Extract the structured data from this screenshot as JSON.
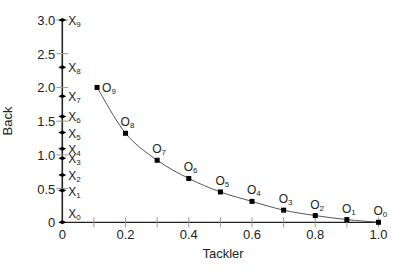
{
  "chart_data": {
    "type": "line",
    "title": "",
    "xlabel": "Tackler",
    "ylabel": "Back",
    "xlim": [
      0,
      1.0
    ],
    "ylim": [
      0,
      3.0
    ],
    "grid": false,
    "legend": null,
    "x_ticks": [
      {
        "value": 0,
        "label": "0"
      },
      {
        "value": 0.1,
        "label": ""
      },
      {
        "value": 0.2,
        "label": "0.2"
      },
      {
        "value": 0.3,
        "label": ""
      },
      {
        "value": 0.4,
        "label": "0.4"
      },
      {
        "value": 0.5,
        "label": ""
      },
      {
        "value": 0.6,
        "label": "0.6"
      },
      {
        "value": 0.7,
        "label": ""
      },
      {
        "value": 0.8,
        "label": "0.8"
      },
      {
        "value": 0.9,
        "label": ""
      },
      {
        "value": 1.0,
        "label": "1.0"
      }
    ],
    "y_ticks": [
      {
        "value": 0,
        "label": "0"
      },
      {
        "value": 0.5,
        "label": "0.5"
      },
      {
        "value": 1.0,
        "label": "1.0"
      },
      {
        "value": 1.5,
        "label": "1.5"
      },
      {
        "value": 2.0,
        "label": "2.0"
      },
      {
        "value": 2.5,
        "label": "2.5"
      },
      {
        "value": 3.0,
        "label": "3.0"
      }
    ],
    "series": [
      {
        "name": "O",
        "marker": "square",
        "connected": true,
        "points": [
          {
            "label": "O",
            "sub": "0",
            "x": 1.0,
            "y": 0.0
          },
          {
            "label": "O",
            "sub": "1",
            "x": 0.9,
            "y": 0.04
          },
          {
            "label": "O",
            "sub": "2",
            "x": 0.8,
            "y": 0.1
          },
          {
            "label": "O",
            "sub": "3",
            "x": 0.7,
            "y": 0.18
          },
          {
            "label": "O",
            "sub": "4",
            "x": 0.6,
            "y": 0.31
          },
          {
            "label": "O",
            "sub": "5",
            "x": 0.5,
            "y": 0.45
          },
          {
            "label": "O",
            "sub": "6",
            "x": 0.4,
            "y": 0.65
          },
          {
            "label": "O",
            "sub": "7",
            "x": 0.3,
            "y": 0.92
          },
          {
            "label": "O",
            "sub": "8",
            "x": 0.2,
            "y": 1.32
          },
          {
            "label": "O",
            "sub": "9",
            "x": 0.11,
            "y": 2.0
          }
        ]
      },
      {
        "name": "X",
        "marker": "diamond",
        "connected": false,
        "points": [
          {
            "label": "X",
            "sub": "0",
            "x": 0,
            "y": 0.0
          },
          {
            "label": "X",
            "sub": "1",
            "x": 0,
            "y": 0.47
          },
          {
            "label": "X",
            "sub": "2",
            "x": 0,
            "y": 0.7
          },
          {
            "label": "X",
            "sub": "3",
            "x": 0,
            "y": 0.95
          },
          {
            "label": "X",
            "sub": "4",
            "x": 0,
            "y": 1.09
          },
          {
            "label": "X",
            "sub": "5",
            "x": 0,
            "y": 1.33
          },
          {
            "label": "X",
            "sub": "6",
            "x": 0,
            "y": 1.57
          },
          {
            "label": "X",
            "sub": "7",
            "x": 0,
            "y": 1.87
          },
          {
            "label": "X",
            "sub": "8",
            "x": 0,
            "y": 2.3
          },
          {
            "label": "X",
            "sub": "9",
            "x": 0,
            "y": 3.0
          }
        ]
      }
    ]
  },
  "layout": {
    "axis_color": "#222222",
    "minor_tick_color": "#999999",
    "curve_color": "#555555",
    "marker_color": "#000000"
  }
}
